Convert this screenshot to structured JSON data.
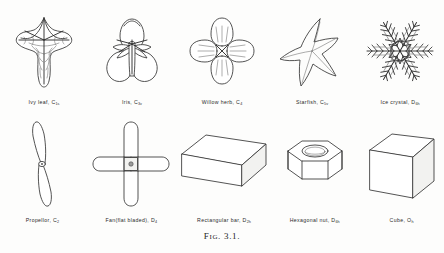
{
  "plate": {
    "caption_prefix": "F",
    "caption_smallcaps": "IG",
    "caption_number": ". 3.1.",
    "caption_full": "FIG. 3.1."
  },
  "rows": [
    {
      "id": "organic",
      "specimens": [
        {
          "key": "ivy-leaf",
          "name": "Ivy leaf",
          "symbol_letter": "C",
          "symbol_sub": "1s",
          "label_name": "Ivy  leaf,",
          "label_symbol": "C",
          "label_sub": "1s",
          "icon": "ivy-leaf-drawing"
        },
        {
          "key": "iris",
          "name": "Iris",
          "symbol_letter": "C",
          "symbol_sub": "3v",
          "label_name": "Iris,",
          "label_symbol": "C",
          "label_sub": "3v",
          "icon": "iris-flower-drawing"
        },
        {
          "key": "willow-herb",
          "name": "Willow herb",
          "symbol_letter": "C",
          "symbol_sub": "4",
          "label_name": "Willow herb,",
          "label_symbol": "C",
          "label_sub": "4",
          "icon": "willow-herb-flower-drawing"
        },
        {
          "key": "starfish",
          "name": "Starfish",
          "symbol_letter": "C",
          "symbol_sub": "5v",
          "label_name": "Starfish,",
          "label_symbol": "C",
          "label_sub": "5v",
          "icon": "starfish-drawing"
        },
        {
          "key": "ice-crystal",
          "name": "Ice crystal",
          "symbol_letter": "D",
          "symbol_sub": "6h",
          "label_name": "Ice crystal,",
          "label_symbol": "D",
          "label_sub": "6h",
          "icon": "snowflake-drawing"
        }
      ]
    },
    {
      "id": "manmade",
      "specimens": [
        {
          "key": "propellor",
          "name": "Propellor",
          "symbol_letter": "C",
          "symbol_sub": "2",
          "label_name": "Propellor,",
          "label_symbol": "C",
          "label_sub": "2",
          "icon": "propellor-drawing"
        },
        {
          "key": "fan",
          "name": "Fan (flat bladed)",
          "symbol_letter": "D",
          "symbol_sub": "4",
          "label_name": "Fan(flat bladed),",
          "label_symbol": "D",
          "label_sub": "4",
          "icon": "four-bladed-fan-drawing"
        },
        {
          "key": "rectangular-bar",
          "name": "Rectangular bar",
          "symbol_letter": "D",
          "symbol_sub": "2h",
          "label_name": "Rectangular bar,",
          "label_symbol": "D",
          "label_sub": "2h",
          "icon": "rectangular-bar-drawing"
        },
        {
          "key": "hexagonal-nut",
          "name": "Hexagonal nut",
          "symbol_letter": "D",
          "symbol_sub": "6h",
          "label_name": "Hexagonal nut,",
          "label_symbol": "D",
          "label_sub": "6h",
          "icon": "hexagonal-nut-drawing"
        },
        {
          "key": "cube",
          "name": "Cube",
          "symbol_letter": "O",
          "symbol_sub": "h",
          "label_name": "Cube,",
          "label_symbol": "O",
          "label_sub": "h",
          "icon": "cube-drawing"
        }
      ]
    }
  ],
  "colors": {
    "page": "#fdfdfc",
    "ink": "#353535",
    "ink_light": "#5a5a5a",
    "text": "#2b2b2b"
  }
}
